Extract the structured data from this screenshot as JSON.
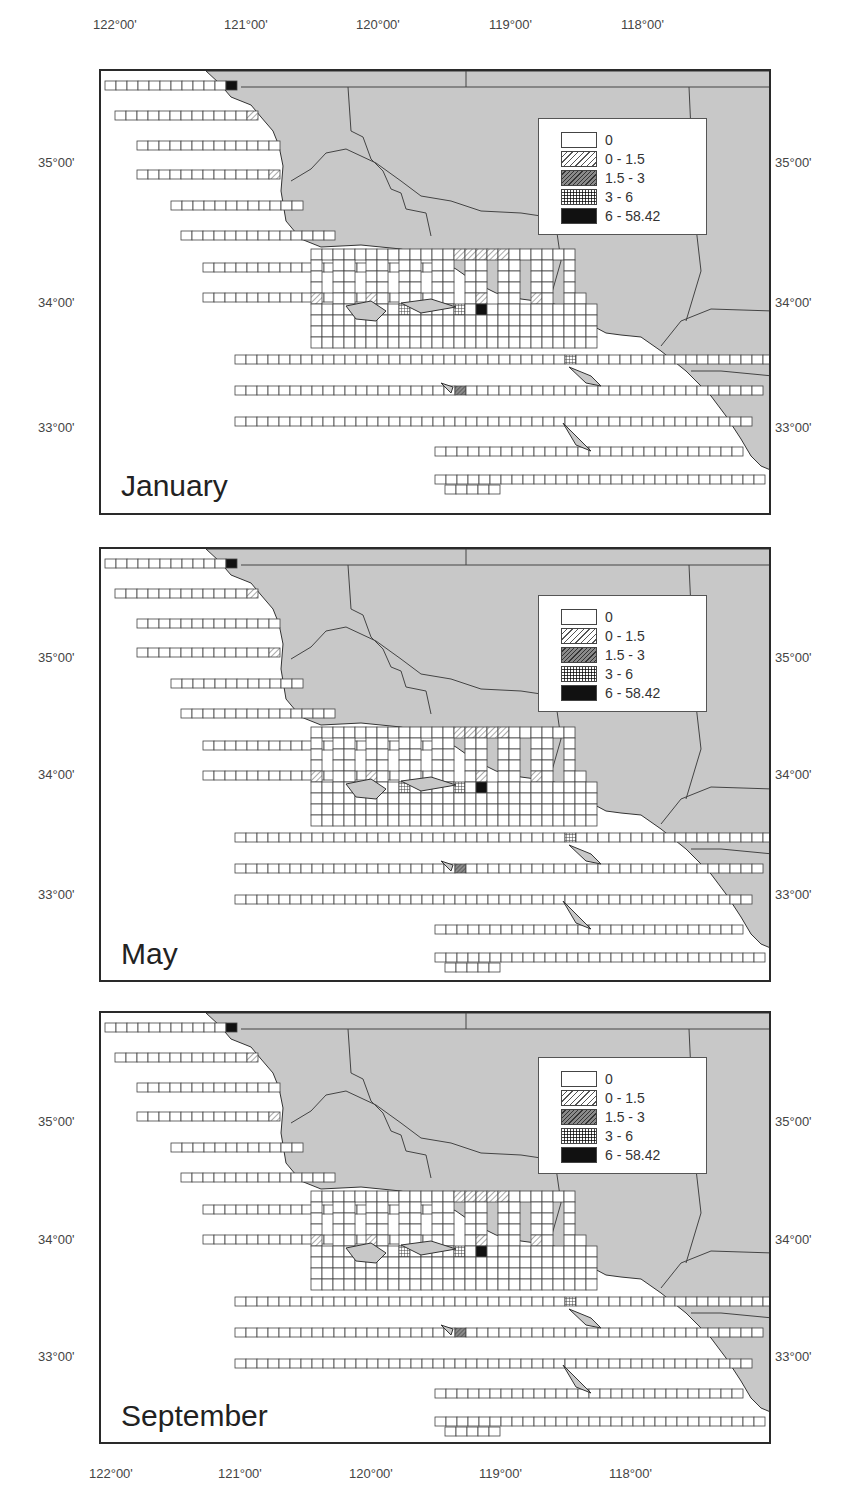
{
  "axes": {
    "lon_labels": [
      "122°00'",
      "121°00'",
      "120°00'",
      "119°00'",
      "118°00'"
    ],
    "lat_labels": [
      "35°00'",
      "34°00'",
      "33°00'"
    ]
  },
  "legend": {
    "items": [
      {
        "label": "0",
        "class": "0"
      },
      {
        "label": "0 - 1.5",
        "class": "1"
      },
      {
        "label": "1.5 - 3",
        "class": "2"
      },
      {
        "label": "3 - 6",
        "class": "3"
      },
      {
        "label": "6 - 58.42",
        "class": "4"
      }
    ]
  },
  "colors": {
    "land": "#c8c8c8",
    "ocean": "#ffffff",
    "frame": "#2a2a2a",
    "cell_stroke": "#444444",
    "class_0": "#ffffff",
    "class_1": "hatch-light",
    "class_2": "#6e6e6e",
    "class_3": "crosshatch",
    "class_4": "#111111"
  },
  "panels": [
    {
      "month": "January"
    },
    {
      "month": "May"
    },
    {
      "month": "September"
    }
  ],
  "chart_data": {
    "type": "heatmap",
    "title": "",
    "xlabel": "Longitude",
    "ylabel": "Latitude",
    "x_ticks": [
      "122°00'",
      "121°00'",
      "120°00'",
      "119°00'",
      "118°00'"
    ],
    "y_ticks": [
      "35°00'",
      "34°00'",
      "33°00'"
    ],
    "legend": [
      "0",
      "0 - 1.5",
      "1.5 - 3",
      "3 - 6",
      "6 - 58.42"
    ],
    "panels": [
      "January",
      "May",
      "September"
    ],
    "grid": "survey transect cells along Southern California coast (Point Conception / Santa Barbara Channel / Channel Islands to San Diego)"
  }
}
